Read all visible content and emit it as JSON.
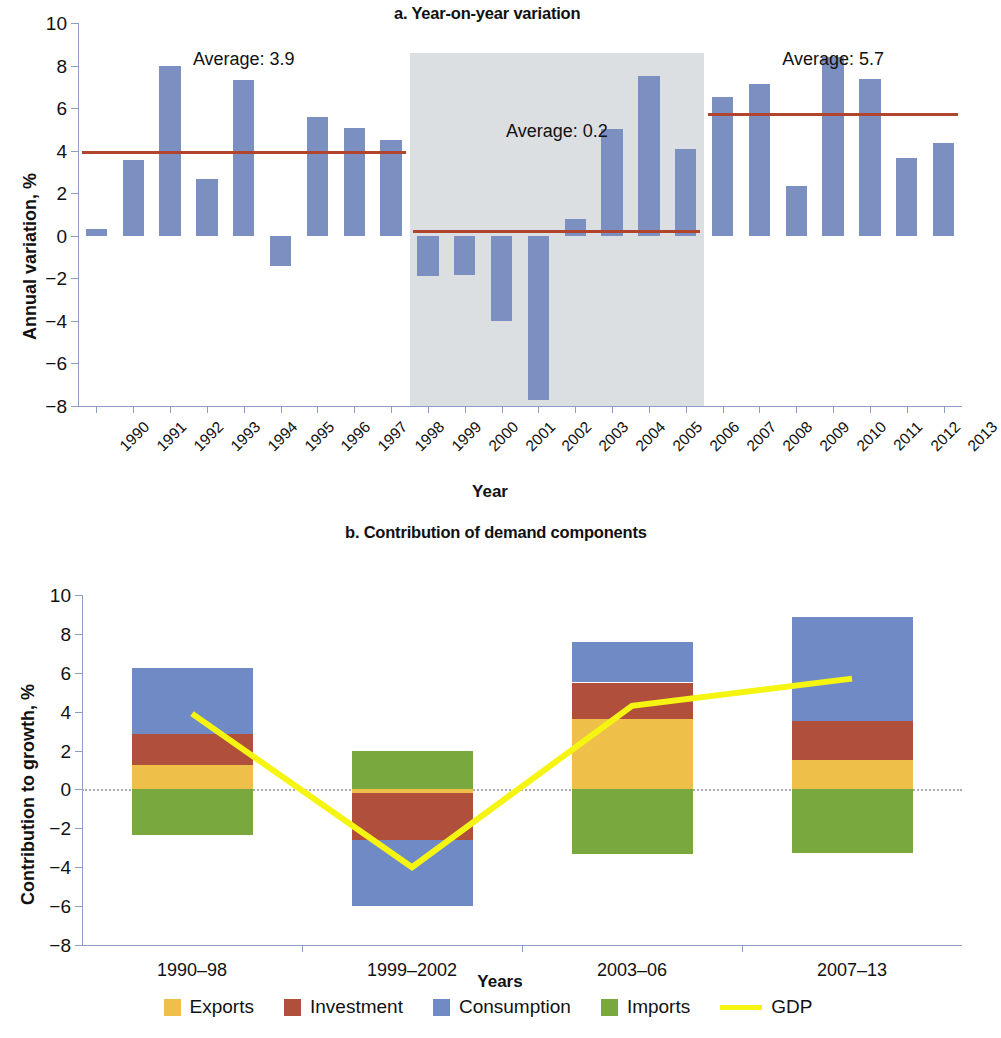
{
  "figure": {
    "panel_a_title": "a. Year-on-year variation",
    "panel_b_title": "b. Contribution of demand components"
  },
  "colors": {
    "bar_blue": "#7b8fc0",
    "average_line": "#b0442f",
    "shade": "#dcdfe2",
    "axis": "#8c9dc4",
    "exports": "#eec04a",
    "investment": "#b0503c",
    "consumption": "#6f8ac4",
    "imports": "#78a83e",
    "gdp": "#f5f511"
  },
  "chart_data": [
    {
      "type": "bar",
      "title": "a. Year-on-year variation",
      "xlabel": "Year",
      "ylabel": "Annual variation, %",
      "ylim": [
        -8,
        10
      ],
      "ytick_step": 2,
      "yticks": [
        "10",
        "8",
        "6",
        "4",
        "2",
        "0",
        "−2",
        "−4",
        "−6",
        "−8"
      ],
      "grid": false,
      "categories": [
        "1990",
        "1991",
        "1992",
        "1993",
        "1994",
        "1995",
        "1996",
        "1997",
        "1998",
        "1999",
        "2000",
        "2001",
        "2002",
        "2003",
        "2004",
        "2005",
        "2006",
        "2007",
        "2008",
        "2009",
        "2010",
        "2011",
        "2012",
        "2013"
      ],
      "values": [
        0.3,
        3.55,
        8.0,
        2.65,
        7.3,
        -1.4,
        5.6,
        5.05,
        4.5,
        -1.9,
        -1.85,
        -4.0,
        -7.7,
        0.8,
        5.0,
        7.5,
        4.1,
        6.5,
        7.15,
        2.35,
        8.4,
        7.35,
        3.65,
        4.35
      ],
      "annotations": [
        {
          "label": "Average: 3.9",
          "value": 3.9,
          "span": [
            "1990",
            "1998"
          ]
        },
        {
          "label": "Average: 0.2",
          "value": 0.2,
          "span": [
            "1999",
            "2006"
          ]
        },
        {
          "label": "Average: 5.7",
          "value": 5.7,
          "span": [
            "2007",
            "2013"
          ]
        }
      ],
      "shaded_region": {
        "from": "1999",
        "to": "2006",
        "color": "#dcdfe2"
      }
    },
    {
      "type": "bar",
      "subtype": "stacked",
      "title": "b. Contribution of demand components",
      "xlabel": "Years",
      "ylabel": "Contribution to growth, %",
      "ylim": [
        -8,
        10
      ],
      "ytick_step": 2,
      "yticks": [
        "10",
        "8",
        "6",
        "4",
        "2",
        "0",
        "−2",
        "−4",
        "−6",
        "−8"
      ],
      "grid": false,
      "legend_position": "bottom",
      "categories": [
        "1990–98",
        "1999–2002",
        "2003–06",
        "2007–13"
      ],
      "series": [
        {
          "name": "Exports",
          "color": "#eec04a",
          "values": [
            1.25,
            -0.2,
            3.6,
            1.5
          ]
        },
        {
          "name": "Investment",
          "color": "#b0503c",
          "values": [
            1.6,
            -2.4,
            1.9,
            2.0
          ]
        },
        {
          "name": "Consumption",
          "color": "#6f8ac4",
          "values": [
            3.4,
            -3.4,
            2.1,
            5.35
          ]
        },
        {
          "name": "Imports",
          "color": "#78a83e",
          "values": [
            -2.35,
            2.0,
            -3.3,
            -3.25
          ]
        }
      ],
      "line_series": {
        "name": "GDP",
        "color": "#f5f511",
        "values": [
          3.9,
          -4.0,
          4.3,
          5.7
        ]
      }
    }
  ],
  "legend": {
    "items": [
      {
        "label": "Exports",
        "color": "#eec04a",
        "marker": "square"
      },
      {
        "label": "Investment",
        "color": "#b0503c",
        "marker": "square"
      },
      {
        "label": "Consumption",
        "color": "#6f8ac4",
        "marker": "square"
      },
      {
        "label": "Imports",
        "color": "#78a83e",
        "marker": "square"
      },
      {
        "label": "GDP",
        "color": "#f5f511",
        "marker": "line"
      }
    ]
  }
}
